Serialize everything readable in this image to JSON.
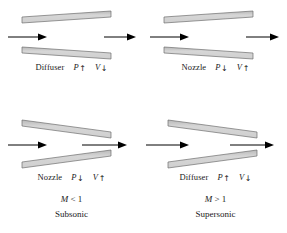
{
  "figure": {
    "name": "nozzle-diffuser-subsonic-supersonic-figure",
    "colors": {
      "wall_fill_light": "#d9d9d9",
      "wall_fill_dark": "#a8a8a8",
      "wall_edge": "#6e6e6e",
      "arrow": "#000000",
      "text": "#1a1a1a",
      "background": "#ffffff"
    },
    "columns": [
      {
        "mach": "M < 1",
        "mach_symbol": "M",
        "mach_relation": "< 1",
        "regime": "Subsonic"
      },
      {
        "mach": "M > 1",
        "mach_symbol": "M",
        "mach_relation": "> 1",
        "regime": "Supersonic"
      }
    ],
    "panels": [
      {
        "id": "top-left",
        "device": "Diffuser",
        "geometry": "diverging",
        "pressure_symbol": "P",
        "pressure_arrow": "↑",
        "pressure_change": "increases",
        "velocity_symbol": "V",
        "velocity_arrow": "↓",
        "velocity_change": "decreases",
        "inlet_arrow": "→",
        "outlet_arrow": "→"
      },
      {
        "id": "top-right",
        "device": "Nozzle",
        "geometry": "diverging",
        "pressure_symbol": "P",
        "pressure_arrow": "↓",
        "pressure_change": "decreases",
        "velocity_symbol": "V",
        "velocity_arrow": "↑",
        "velocity_change": "increases",
        "inlet_arrow": "→",
        "outlet_arrow": "→"
      },
      {
        "id": "bottom-left",
        "device": "Nozzle",
        "geometry": "converging",
        "pressure_symbol": "P",
        "pressure_arrow": "↓",
        "pressure_change": "decreases",
        "velocity_symbol": "V",
        "velocity_arrow": "↑",
        "velocity_change": "increases",
        "inlet_arrow": "→",
        "outlet_arrow": "→"
      },
      {
        "id": "bottom-right",
        "device": "Diffuser",
        "geometry": "converging",
        "pressure_symbol": "P",
        "pressure_arrow": "↑",
        "pressure_change": "increases",
        "velocity_symbol": "V",
        "velocity_arrow": "↓",
        "velocity_change": "decreases",
        "inlet_arrow": "→",
        "outlet_arrow": "→"
      }
    ]
  }
}
